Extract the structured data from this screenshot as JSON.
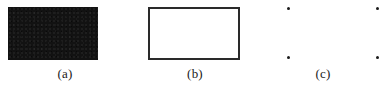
{
  "figure": {
    "width": 386,
    "height": 89,
    "background_color": "#ffffff",
    "ink_color": "#1a1a1a"
  },
  "panels": [
    {
      "id": "a",
      "caption": "(a)",
      "content_type": "filled-rectangle",
      "shape": {
        "kind": "rectangle",
        "fill": "solid",
        "fill_color": "#121212",
        "stroke": "none",
        "x": 8,
        "y": 7,
        "width": 90,
        "height": 53
      }
    },
    {
      "id": "b",
      "caption": "(b)",
      "content_type": "outlined-rectangle",
      "shape": {
        "kind": "rectangle",
        "fill": "none",
        "fill_color": "#ffffff",
        "stroke": "solid",
        "stroke_color": "#2a2a2a",
        "stroke_width": 2,
        "x": 18,
        "y": 7,
        "width": 92,
        "height": 53
      }
    },
    {
      "id": "c",
      "caption": "(c)",
      "content_type": "corner-points",
      "points": [
        {
          "name": "top-left",
          "x": 27,
          "y": 7
        },
        {
          "name": "top-right",
          "x": 116,
          "y": 7
        },
        {
          "name": "bottom-left",
          "x": 27,
          "y": 56
        },
        {
          "name": "bottom-right",
          "x": 116,
          "y": 56
        }
      ],
      "point_color": "#1a1a1a",
      "point_size": 3
    }
  ]
}
